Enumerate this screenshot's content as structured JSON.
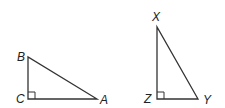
{
  "diagram": {
    "type": "geometry",
    "triangles": [
      {
        "name": "triangle-ABC",
        "right_angle_at": "C",
        "vertices": {
          "B": {
            "label": "B",
            "x": 28,
            "y": 57,
            "lx": 17,
            "ly": 61
          },
          "C": {
            "label": "C",
            "x": 28,
            "y": 99,
            "lx": 14,
            "ly": 103
          },
          "A": {
            "label": "A",
            "x": 97,
            "y": 99,
            "lx": 101,
            "ly": 104
          }
        }
      },
      {
        "name": "triangle-XYZ",
        "right_angle_at": "Z",
        "vertices": {
          "X": {
            "label": "X",
            "x": 157,
            "y": 27,
            "lx": 152,
            "ly": 21
          },
          "Z": {
            "label": "Z",
            "x": 157,
            "y": 99,
            "lx": 143,
            "ly": 103
          },
          "Y": {
            "label": "Y",
            "x": 198,
            "y": 99,
            "lx": 203,
            "ly": 104
          }
        }
      }
    ],
    "colors": {
      "stroke": "#333333",
      "background": "#ffffff"
    }
  }
}
